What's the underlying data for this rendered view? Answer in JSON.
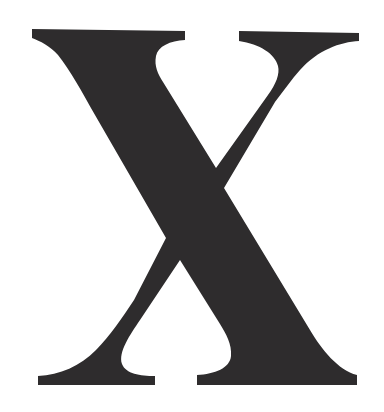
{
  "glyph": {
    "character": "X",
    "fill_color": "#2e2c2d",
    "background_color": "#ffffff"
  }
}
